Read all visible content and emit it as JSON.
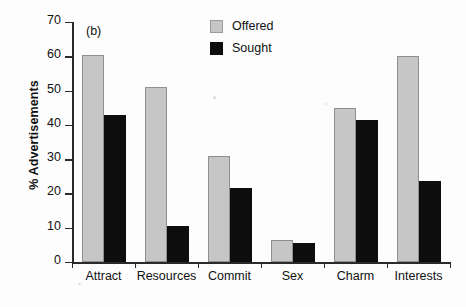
{
  "chart_data": {
    "type": "bar",
    "title": "",
    "panel_label": "(b)",
    "xlabel": "",
    "ylabel": "% Advertisements",
    "categories": [
      "Attract",
      "Resources",
      "Commit",
      "Sex",
      "Charm",
      "Interests"
    ],
    "series": [
      {
        "name": "Offered",
        "color": "#c6c6c6",
        "values": [
          60.5,
          51,
          31,
          6.5,
          45,
          60
        ]
      },
      {
        "name": "Sought",
        "color": "#0d0d0d",
        "values": [
          43,
          10.5,
          21.5,
          5.5,
          41.5,
          23.5
        ]
      }
    ],
    "ylim": [
      0,
      70
    ],
    "ytick_labels": [
      "0",
      "10",
      "20",
      "30",
      "40",
      "50",
      "60",
      "70"
    ],
    "ytick_values": [
      0,
      10,
      20,
      30,
      40,
      50,
      60,
      70
    ],
    "grid": false,
    "legend_position": "top-right",
    "legend": [
      "Offered",
      "Sought"
    ]
  }
}
